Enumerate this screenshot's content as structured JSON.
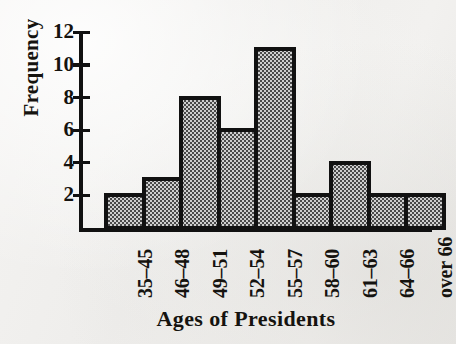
{
  "chart_data": {
    "type": "bar",
    "title": "",
    "subtitle": "",
    "xlabel": "Ages of Presidents",
    "ylabel": "Frequency",
    "categories": [
      "35–45",
      "46–48",
      "49–51",
      "52–54",
      "55–57",
      "58–60",
      "61–63",
      "64–66",
      "over 66"
    ],
    "values": [
      2,
      3,
      8,
      6,
      11,
      2,
      4,
      2,
      2
    ],
    "ylim": [
      0,
      12
    ],
    "yticks": [
      2,
      4,
      6,
      8,
      10,
      12
    ],
    "ytick_labels": [
      "2",
      "4",
      "6",
      "8",
      "10",
      "12"
    ],
    "grid": false,
    "legend": null,
    "annotations": [],
    "style": {
      "bar_fill": "#8f8f8f",
      "bar_edge": "#111111",
      "axis_color": "#111111",
      "text_color": "#15130f",
      "background": "#f1f0ee",
      "bar_pattern": "checkerboard-halftone"
    }
  },
  "axis": {
    "y_axis_name": "frequency-axis",
    "x_axis_name": "ages-axis"
  }
}
